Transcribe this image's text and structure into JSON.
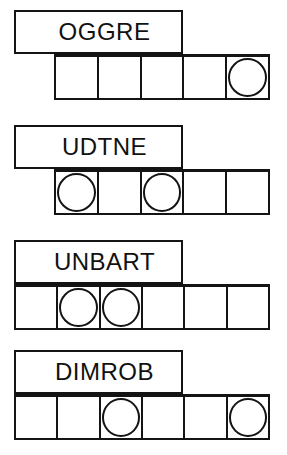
{
  "style": {
    "ink": "#141414",
    "paper": "#ffffff",
    "text": "#111111"
  },
  "rows": [
    {
      "id": "row-1",
      "word": "OGGRE",
      "word_box": {
        "x": 14,
        "y": 10,
        "w": 169,
        "h": 44
      },
      "grid": {
        "x": 54,
        "y": 54,
        "w": 216,
        "h": 46,
        "cells": 5,
        "cell_w": 43
      },
      "circles": [
        5
      ]
    },
    {
      "id": "row-2",
      "word": "UDTNE",
      "word_box": {
        "x": 14,
        "y": 125,
        "w": 169,
        "h": 44
      },
      "grid": {
        "x": 54,
        "y": 169,
        "w": 216,
        "h": 46,
        "cells": 5,
        "cell_w": 43
      },
      "circles": [
        1,
        3
      ]
    },
    {
      "id": "row-3",
      "word": "UNBART",
      "word_box": {
        "x": 14,
        "y": 240,
        "w": 169,
        "h": 44
      },
      "grid": {
        "x": 14,
        "y": 284,
        "w": 256,
        "h": 46,
        "cells": 6,
        "cell_w": 42.6
      },
      "circles": [
        2,
        3
      ]
    },
    {
      "id": "row-4",
      "word": "DIMROB",
      "word_box": {
        "x": 14,
        "y": 350,
        "w": 169,
        "h": 44
      },
      "grid": {
        "x": 14,
        "y": 394,
        "w": 256,
        "h": 46,
        "cells": 6,
        "cell_w": 42.6
      },
      "circles": [
        3,
        6
      ]
    }
  ]
}
